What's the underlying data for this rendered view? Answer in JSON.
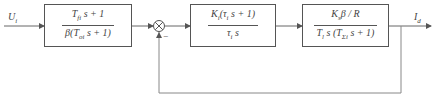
{
  "diagram": {
    "type": "block-diagram",
    "input": {
      "symbol": "U",
      "subscript": "i"
    },
    "output": {
      "symbol": "I",
      "subscript": "d"
    },
    "blocks": [
      {
        "id": "filter-block",
        "numerator": "T<sub>fi</sub> s + 1",
        "denominator": "β(T<sub>oi</sub> s + 1)",
        "numerator_text": "Tfi s+1",
        "denominator_text": "β(Toi s+1)"
      },
      {
        "id": "pi-controller-block",
        "numerator": "K<sub>i</sub>(τ<sub>i</sub> s + 1)",
        "denominator": "τ<sub>i</sub> s",
        "numerator_text": "Ki(τi s+1)",
        "denominator_text": "τi s"
      },
      {
        "id": "plant-block",
        "numerator": "K<sub>s</sub>β / R",
        "denominator": "T<sub>l</sub> s (T<sub>Σi</sub> s + 1)",
        "numerator_text": "Ksβ/R",
        "denominator_text": "Tl s(TΣi s+1)"
      }
    ],
    "summing_junction": {
      "feedback_sign": "−"
    },
    "feedback": "unity negative feedback from output to summing junction",
    "colors": {
      "line": "#555555",
      "background": "#ffffff"
    }
  }
}
